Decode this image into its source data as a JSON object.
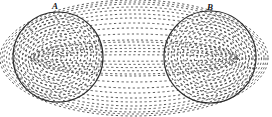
{
  "figure": {
    "type": "line-diagram",
    "title": "",
    "background_color": "#ffffff",
    "width": 272,
    "height": 117,
    "labels": [
      {
        "name": "A",
        "text": "A",
        "x": 56,
        "y": 6
      },
      {
        "name": "B",
        "text": "B",
        "x": 211,
        "y": 7
      }
    ],
    "stroke_color": "#2b2b2b",
    "dash_color": "#333333",
    "solid_circles": [
      {
        "name": "circle-A",
        "cx": 58,
        "cy": 57,
        "r": 45
      },
      {
        "name": "circle-B",
        "cx": 210,
        "cy": 57,
        "r": 46
      }
    ],
    "focus_points": [
      {
        "name": "focus-A",
        "cx": 58,
        "cy": 57
      },
      {
        "name": "focus-B",
        "cx": 210,
        "cy": 57
      }
    ],
    "inner_loop_count": 7,
    "outer_loop_count": 6,
    "dash_pattern": "2.2 2.6",
    "caption": ""
  },
  "chart_data": {
    "type": "line",
    "xlabel": "",
    "ylabel": "",
    "series": [
      {
        "name": "circle-A-boundary",
        "kind": "solid-circle",
        "center": [
          58,
          57
        ],
        "radius": 45
      },
      {
        "name": "circle-B-boundary",
        "kind": "solid-circle",
        "center": [
          210,
          57
        ],
        "radius": 46
      },
      {
        "name": "inner-loops-A",
        "kind": "dashed-concentric-ellipses",
        "center": [
          58,
          57
        ],
        "rx": [
          6,
          13,
          20,
          27,
          33,
          39,
          44
        ],
        "ry": [
          5,
          11,
          17,
          23,
          29,
          35,
          41
        ],
        "rotation_deg": -14
      },
      {
        "name": "inner-loops-B",
        "kind": "dashed-concentric-ellipses",
        "center": [
          210,
          57
        ],
        "rx": [
          6,
          13,
          20,
          27,
          33,
          39,
          45
        ],
        "ry": [
          5,
          11,
          17,
          23,
          29,
          35,
          42
        ],
        "rotation_deg": 14
      },
      {
        "name": "outer-loops-AB",
        "kind": "dashed-concentric-ellipses",
        "center": [
          134,
          58
        ],
        "rx": [
          104,
          112,
          119,
          125,
          130,
          134
        ],
        "ry": [
          18,
          30,
          40,
          48,
          54,
          58
        ],
        "rotation_deg": 0
      }
    ],
    "legend": [],
    "grid": false
  }
}
